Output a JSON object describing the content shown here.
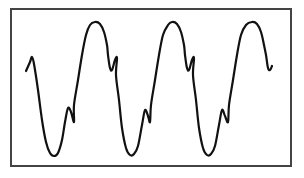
{
  "figure": {
    "cycles": 3,
    "line_color": "#111111",
    "frame_color": "#444444",
    "background": "#ffffff"
  },
  "chart_data": {
    "type": "line",
    "title": "",
    "xlabel": "",
    "ylabel": "",
    "grid": false,
    "legend": "none",
    "series": [
      {
        "name": "waveform",
        "description": "Three cycles of a distorted periodic wave: each cycle has a main trough, a small secondary bump on the rising edge, a main peak, and a small dip/bump on the falling edge",
        "points_px": [
          [
            26,
            71
          ],
          [
            30,
            62
          ],
          [
            32,
            57
          ],
          [
            34,
            64
          ],
          [
            38,
            90
          ],
          [
            42,
            120
          ],
          [
            46,
            142
          ],
          [
            50,
            153
          ],
          [
            54,
            156
          ],
          [
            58,
            153
          ],
          [
            62,
            140
          ],
          [
            65,
            122
          ],
          [
            68,
            108
          ],
          [
            71,
            112
          ],
          [
            74,
            122
          ],
          [
            74,
            105
          ],
          [
            78,
            80
          ],
          [
            82,
            55
          ],
          [
            86,
            35
          ],
          [
            90,
            25
          ],
          [
            95,
            22
          ],
          [
            100,
            24
          ],
          [
            104,
            32
          ],
          [
            107,
            45
          ],
          [
            108,
            55
          ],
          [
            110,
            68
          ],
          [
            112,
            70
          ],
          [
            115,
            60
          ],
          [
            117,
            58
          ],
          [
            116,
            75
          ],
          [
            119,
            100
          ],
          [
            122,
            128
          ],
          [
            126,
            148
          ],
          [
            130,
            155
          ],
          [
            134,
            154
          ],
          [
            138,
            146
          ],
          [
            142,
            125
          ],
          [
            145,
            110
          ],
          [
            148,
            116
          ],
          [
            150,
            122
          ],
          [
            151,
            105
          ],
          [
            155,
            80
          ],
          [
            159,
            55
          ],
          [
            163,
            35
          ],
          [
            168,
            25
          ],
          [
            172,
            22
          ],
          [
            177,
            24
          ],
          [
            181,
            32
          ],
          [
            184,
            45
          ],
          [
            185,
            55
          ],
          [
            187,
            68
          ],
          [
            189,
            70
          ],
          [
            192,
            60
          ],
          [
            194,
            58
          ],
          [
            193,
            75
          ],
          [
            196,
            100
          ],
          [
            199,
            128
          ],
          [
            203,
            148
          ],
          [
            207,
            155
          ],
          [
            211,
            154
          ],
          [
            215,
            146
          ],
          [
            219,
            125
          ],
          [
            222,
            110
          ],
          [
            225,
            116
          ],
          [
            228,
            122
          ],
          [
            229,
            105
          ],
          [
            233,
            80
          ],
          [
            237,
            55
          ],
          [
            241,
            35
          ],
          [
            246,
            25
          ],
          [
            252,
            22
          ],
          [
            257,
            24
          ],
          [
            261,
            32
          ],
          [
            264,
            45
          ],
          [
            266,
            55
          ],
          [
            268,
            68
          ],
          [
            270,
            70
          ],
          [
            272,
            66
          ]
        ]
      }
    ]
  }
}
